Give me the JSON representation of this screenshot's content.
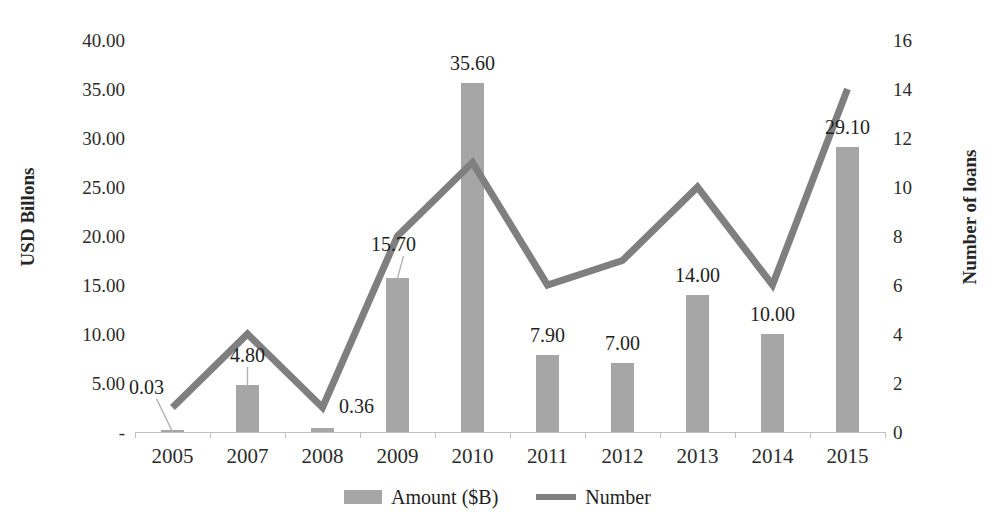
{
  "chart_data": {
    "type": "bar",
    "title": "",
    "subtitle": "",
    "xlabel": "",
    "ylabel": "USD Billons",
    "y2label": "Number of loans",
    "categories": [
      "2005",
      "2007",
      "2008",
      "2009",
      "2010",
      "2011",
      "2012",
      "2013",
      "2014",
      "2015"
    ],
    "ylim": [
      0,
      40
    ],
    "y2lim": [
      0,
      16
    ],
    "grid": false,
    "legend_position": "bottom",
    "series": [
      {
        "name": "Amount ($B)",
        "type": "bar",
        "axis": "left",
        "color": "#a6a6a6",
        "values": [
          0.03,
          4.8,
          0.36,
          15.7,
          35.6,
          7.9,
          7.0,
          14.0,
          10.0,
          29.1
        ],
        "data_labels": [
          "0.03",
          "4.80",
          "0.36",
          "15.70",
          "35.60",
          "7.90",
          "7.00",
          "14.00",
          "10.00",
          "29.10"
        ]
      },
      {
        "name": "Number",
        "type": "line",
        "axis": "right",
        "color": "#7f7f7f",
        "values": [
          1,
          4,
          1,
          8,
          11,
          6,
          7,
          10,
          6,
          14
        ]
      }
    ],
    "left_axis": {
      "title": "USD Billons",
      "ticks": [
        {
          "value": 40,
          "label": "40.00"
        },
        {
          "value": 35,
          "label": "35.00"
        },
        {
          "value": 30,
          "label": "30.00"
        },
        {
          "value": 25,
          "label": "25.00"
        },
        {
          "value": 20,
          "label": "20.00"
        },
        {
          "value": 15,
          "label": "15.00"
        },
        {
          "value": 10,
          "label": "10.00"
        },
        {
          "value": 5,
          "label": "5.00"
        },
        {
          "value": 0,
          "label": "-"
        }
      ]
    },
    "right_axis": {
      "title": "Number of loans",
      "ticks": [
        {
          "value": 16,
          "label": "16"
        },
        {
          "value": 14,
          "label": "14"
        },
        {
          "value": 12,
          "label": "12"
        },
        {
          "value": 10,
          "label": "10"
        },
        {
          "value": 8,
          "label": "8"
        },
        {
          "value": 6,
          "label": "6"
        },
        {
          "value": 4,
          "label": "4"
        },
        {
          "value": 2,
          "label": "2"
        },
        {
          "value": 0,
          "label": "0"
        }
      ]
    },
    "legend": [
      {
        "label": "Amount ($B)",
        "marker": "bar-swatch",
        "color": "#a6a6a6"
      },
      {
        "label": "Number",
        "marker": "line-swatch",
        "color": "#7f7f7f"
      }
    ],
    "annotations": [
      {
        "text": "0.03",
        "note": "leader line from label to 2005 bar"
      },
      {
        "text": "15.70",
        "note": "leader line from label to 2009 bar"
      },
      {
        "text": "4.80",
        "note": "leader line from label to 2007 bar"
      }
    ]
  },
  "colors": {
    "bar": "#a6a6a6",
    "line": "#7f7f7f",
    "axis": "#bfbfbf",
    "text": "#2b2b2b",
    "background": "#ffffff"
  }
}
